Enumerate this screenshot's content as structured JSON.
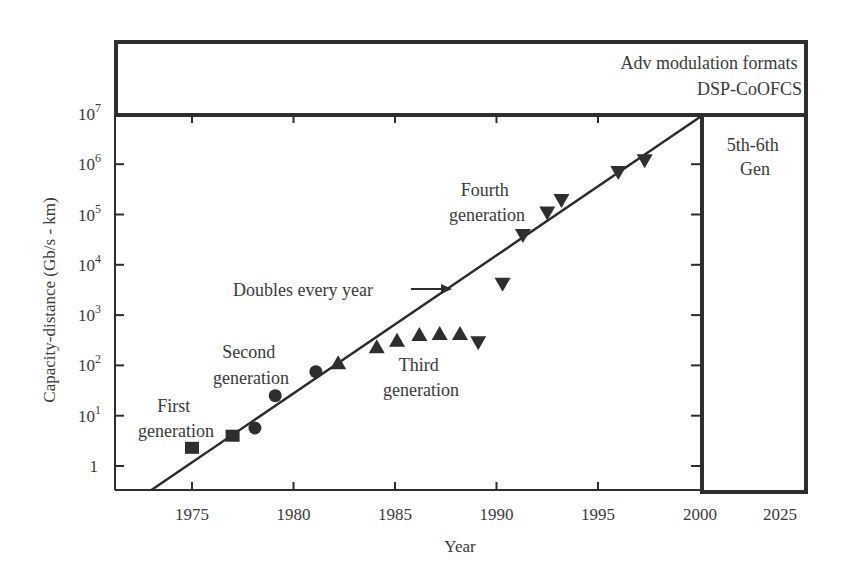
{
  "chart_data": {
    "type": "scatter",
    "title": "",
    "xlabel": "Year",
    "ylabel": "Capacity-distance (Gb/s - km)",
    "yscale": "log",
    "ylim": [
      0.33,
      10000000
    ],
    "xlim": [
      1971.2,
      2000
    ],
    "x_ticks": [
      1975,
      1980,
      1985,
      1990,
      1995,
      2000
    ],
    "x_tick_labels": [
      "1975",
      "1980",
      "1985",
      "1990",
      "1995",
      "2000",
      "2025"
    ],
    "y_ticks": [
      1,
      10,
      100,
      1000,
      10000,
      100000,
      1000000,
      10000000
    ],
    "y_tick_labels": [
      {
        "base": "1",
        "exp": ""
      },
      {
        "base": "10",
        "exp": "1"
      },
      {
        "base": "10",
        "exp": "2"
      },
      {
        "base": "10",
        "exp": "3"
      },
      {
        "base": "10",
        "exp": "4"
      },
      {
        "base": "10",
        "exp": "5"
      },
      {
        "base": "10",
        "exp": "6"
      },
      {
        "base": "10",
        "exp": "7"
      }
    ],
    "grid": false,
    "legend": null,
    "series": [
      {
        "name": "First generation",
        "marker": "square",
        "points": [
          [
            1975.0,
            2.3
          ],
          [
            1977.0,
            4.0
          ]
        ]
      },
      {
        "name": "Second generation",
        "marker": "circle",
        "points": [
          [
            1978.1,
            5.7
          ],
          [
            1979.1,
            25
          ],
          [
            1981.1,
            75
          ]
        ]
      },
      {
        "name": "Third generation",
        "marker": "triangle-up",
        "points": [
          [
            1982.2,
            110
          ],
          [
            1984.1,
            230
          ],
          [
            1985.1,
            310
          ],
          [
            1986.2,
            400
          ],
          [
            1987.2,
            420
          ],
          [
            1988.2,
            420
          ]
        ]
      },
      {
        "name": "Fourth generation",
        "marker": "triangle-down",
        "points": [
          [
            1989.1,
            290
          ],
          [
            1990.3,
            4200
          ],
          [
            1991.3,
            39000
          ],
          [
            1992.5,
            110000
          ],
          [
            1993.2,
            195000
          ],
          [
            1996.0,
            700000
          ],
          [
            1997.3,
            1200000
          ]
        ]
      }
    ],
    "trend_line": {
      "label": "Doubles every year",
      "from": [
        1973.0,
        0.33
      ],
      "to": [
        2000.0,
        10000000
      ]
    },
    "annotations": [
      {
        "id": "first",
        "lines": [
          "First",
          "generation"
        ]
      },
      {
        "id": "second",
        "lines": [
          "Second",
          "generation"
        ]
      },
      {
        "id": "third",
        "lines": [
          "Third",
          "generation"
        ]
      },
      {
        "id": "fourth",
        "lines": [
          "Fourth",
          "generation"
        ]
      },
      {
        "id": "doubles",
        "lines": [
          "Doubles every year"
        ]
      }
    ],
    "top_band": {
      "lines": [
        "Adv modulation formats",
        "DSP-CoOFCS"
      ]
    },
    "right_band": {
      "lines": [
        "5th-6th",
        "Gen"
      ],
      "x_label": "2025"
    },
    "colors": {
      "ink": "#2e2e2e",
      "text": "#3a3a3a",
      "background": "#ffffff"
    }
  }
}
